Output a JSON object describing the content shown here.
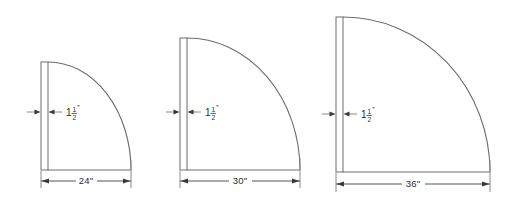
{
  "drawing": {
    "title": "Quarter Round Panel Sizes",
    "type": "technical-dimension-drawing",
    "unit": "inches",
    "line_color": "#6c6c6c",
    "text_color": "#2b2b2b",
    "background": "#ffffff"
  },
  "figures": [
    {
      "id": "figure-24",
      "radius_label": "24\"",
      "radius_value": 24,
      "thickness_whole": "1",
      "thickness_numerator": "1",
      "thickness_denominator": "2",
      "thickness_mark": "”",
      "thickness_label": "1 1/2\"",
      "thickness_value": 1.5,
      "panel": {
        "x": 41,
        "y": 62,
        "w": 7,
        "h": 108
      },
      "arc": {
        "cx": 48,
        "cy": 170,
        "rx": 83,
        "ry": 108
      },
      "dim_line": {
        "y": 181,
        "x1": 41,
        "x2": 131
      },
      "dim_text": {
        "x": 86,
        "y": 184
      },
      "thick_dim": {
        "y": 112,
        "left_x": 27,
        "right_x": 62,
        "text_x": 66,
        "text_y": 115
      }
    },
    {
      "id": "figure-30",
      "radius_label": "30\"",
      "radius_value": 30,
      "thickness_whole": "1",
      "thickness_numerator": "1",
      "thickness_denominator": "2",
      "thickness_mark": "”",
      "thickness_label": "1 1/2\"",
      "thickness_value": 1.5,
      "panel": {
        "x": 180,
        "y": 38,
        "w": 7,
        "h": 132
      },
      "arc": {
        "cx": 187,
        "cy": 170,
        "rx": 113,
        "ry": 132
      },
      "dim_line": {
        "y": 181,
        "x1": 180,
        "x2": 300
      },
      "dim_text": {
        "x": 240,
        "y": 184
      },
      "thick_dim": {
        "y": 112,
        "left_x": 166,
        "right_x": 201,
        "text_x": 205,
        "text_y": 115
      }
    },
    {
      "id": "figure-36",
      "radius_label": "36\"",
      "radius_value": 36,
      "thickness_whole": "1",
      "thickness_numerator": "1",
      "thickness_denominator": "2",
      "thickness_mark": "”",
      "thickness_label": "1 1/2\"",
      "thickness_value": 1.5,
      "panel": {
        "x": 336,
        "y": 17,
        "w": 7,
        "h": 155
      },
      "arc": {
        "cx": 343,
        "cy": 172,
        "rx": 147,
        "ry": 155
      },
      "dim_line": {
        "y": 184,
        "x1": 336,
        "x2": 490
      },
      "dim_text": {
        "x": 413,
        "y": 187
      },
      "thick_dim": {
        "y": 114,
        "left_x": 322,
        "right_x": 357,
        "text_x": 361,
        "text_y": 117
      }
    }
  ]
}
